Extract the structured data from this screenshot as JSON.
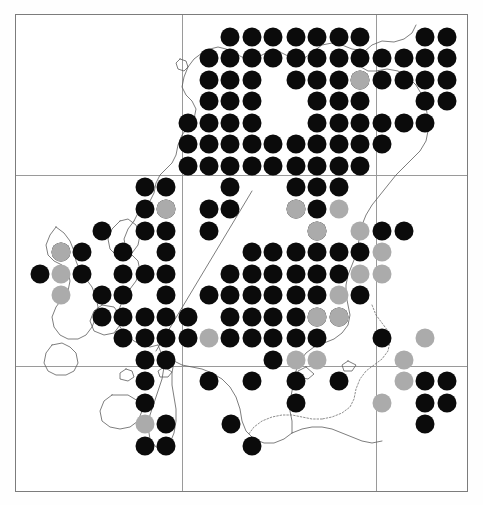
{
  "map": {
    "title": "Species distribution map",
    "region": "Scotland",
    "projection_note": "British National Grid",
    "plate": {
      "x": 15,
      "y": 14,
      "width": 453,
      "height": 478
    },
    "frame_color": "#7c7c7c",
    "background_color": "#ffffff",
    "gridlines": {
      "color": "#9a9a9a",
      "vertical_x": [
        166,
        360
      ],
      "horizontal_y": [
        160,
        351
      ],
      "unit": "100 km square"
    },
    "coastline": {
      "color": "#5d5d5d",
      "inland_border_color": "#5d5d5d",
      "inland_border_style": "dotted"
    }
  },
  "legend": {
    "symbols": [
      {
        "key": "black",
        "label": "Recent record",
        "color": "#0b0b0b",
        "shape": "filled-circle"
      },
      {
        "key": "grey",
        "label": "Older record",
        "color": "#ababab",
        "shape": "filled-circle"
      }
    ],
    "visible": false
  },
  "chart_data": {
    "type": "scatter",
    "xlabel": "",
    "ylabel": "",
    "grid": true,
    "legend_position": "none",
    "xlim": [
      0,
      453
    ],
    "ylim": [
      0,
      478
    ],
    "symbol_diameter_px": 19,
    "grid_spacing_px": 21.5,
    "series": [
      {
        "name": "Recent record",
        "color": "#0b0b0b",
        "count": 216,
        "points": [
          [
            214,
            22
          ],
          [
            236,
            22
          ],
          [
            257,
            22
          ],
          [
            280,
            22
          ],
          [
            301,
            22
          ],
          [
            323,
            22
          ],
          [
            344,
            22
          ],
          [
            409,
            22
          ],
          [
            431,
            22
          ],
          [
            193,
            43
          ],
          [
            214,
            43
          ],
          [
            236,
            43
          ],
          [
            257,
            43
          ],
          [
            280,
            43
          ],
          [
            301,
            43
          ],
          [
            323,
            43
          ],
          [
            344,
            43
          ],
          [
            366,
            43
          ],
          [
            388,
            43
          ],
          [
            409,
            43
          ],
          [
            431,
            43
          ],
          [
            193,
            65
          ],
          [
            214,
            65
          ],
          [
            236,
            65
          ],
          [
            280,
            65
          ],
          [
            301,
            65
          ],
          [
            323,
            65
          ],
          [
            344,
            65
          ],
          [
            366,
            65
          ],
          [
            388,
            65
          ],
          [
            409,
            65
          ],
          [
            431,
            65
          ],
          [
            193,
            86
          ],
          [
            214,
            86
          ],
          [
            236,
            86
          ],
          [
            301,
            86
          ],
          [
            323,
            86
          ],
          [
            344,
            86
          ],
          [
            409,
            86
          ],
          [
            431,
            86
          ],
          [
            172,
            108
          ],
          [
            193,
            108
          ],
          [
            214,
            108
          ],
          [
            236,
            108
          ],
          [
            301,
            108
          ],
          [
            323,
            108
          ],
          [
            344,
            108
          ],
          [
            366,
            108
          ],
          [
            388,
            108
          ],
          [
            409,
            108
          ],
          [
            172,
            129
          ],
          [
            193,
            129
          ],
          [
            214,
            129
          ],
          [
            236,
            129
          ],
          [
            257,
            129
          ],
          [
            280,
            129
          ],
          [
            301,
            129
          ],
          [
            323,
            129
          ],
          [
            344,
            129
          ],
          [
            366,
            129
          ],
          [
            172,
            151
          ],
          [
            193,
            151
          ],
          [
            214,
            151
          ],
          [
            236,
            151
          ],
          [
            257,
            151
          ],
          [
            280,
            151
          ],
          [
            301,
            151
          ],
          [
            323,
            151
          ],
          [
            344,
            151
          ],
          [
            129,
            172
          ],
          [
            150,
            172
          ],
          [
            214,
            172
          ],
          [
            280,
            172
          ],
          [
            301,
            172
          ],
          [
            323,
            172
          ],
          [
            129,
            194
          ],
          [
            150,
            194
          ],
          [
            193,
            194
          ],
          [
            214,
            194
          ],
          [
            280,
            194
          ],
          [
            301,
            194
          ],
          [
            86,
            216
          ],
          [
            129,
            216
          ],
          [
            150,
            216
          ],
          [
            193,
            216
          ],
          [
            301,
            216
          ],
          [
            366,
            216
          ],
          [
            388,
            216
          ],
          [
            45,
            237
          ],
          [
            66,
            237
          ],
          [
            107,
            237
          ],
          [
            150,
            237
          ],
          [
            236,
            237
          ],
          [
            257,
            237
          ],
          [
            280,
            237
          ],
          [
            301,
            237
          ],
          [
            323,
            237
          ],
          [
            344,
            237
          ],
          [
            24,
            259
          ],
          [
            66,
            259
          ],
          [
            107,
            259
          ],
          [
            129,
            259
          ],
          [
            150,
            259
          ],
          [
            214,
            259
          ],
          [
            236,
            259
          ],
          [
            257,
            259
          ],
          [
            280,
            259
          ],
          [
            301,
            259
          ],
          [
            323,
            259
          ],
          [
            86,
            280
          ],
          [
            107,
            280
          ],
          [
            150,
            280
          ],
          [
            193,
            280
          ],
          [
            214,
            280
          ],
          [
            236,
            280
          ],
          [
            257,
            280
          ],
          [
            280,
            280
          ],
          [
            301,
            280
          ],
          [
            344,
            280
          ],
          [
            86,
            302
          ],
          [
            107,
            302
          ],
          [
            129,
            302
          ],
          [
            150,
            302
          ],
          [
            172,
            302
          ],
          [
            214,
            302
          ],
          [
            236,
            302
          ],
          [
            257,
            302
          ],
          [
            280,
            302
          ],
          [
            301,
            302
          ],
          [
            323,
            302
          ],
          [
            107,
            323
          ],
          [
            129,
            323
          ],
          [
            150,
            323
          ],
          [
            172,
            323
          ],
          [
            214,
            323
          ],
          [
            236,
            323
          ],
          [
            257,
            323
          ],
          [
            280,
            323
          ],
          [
            301,
            323
          ],
          [
            366,
            323
          ],
          [
            129,
            345
          ],
          [
            150,
            345
          ],
          [
            257,
            345
          ],
          [
            129,
            366
          ],
          [
            193,
            366
          ],
          [
            236,
            366
          ],
          [
            280,
            366
          ],
          [
            323,
            366
          ],
          [
            409,
            366
          ],
          [
            431,
            366
          ],
          [
            129,
            388
          ],
          [
            280,
            388
          ],
          [
            409,
            388
          ],
          [
            431,
            388
          ],
          [
            150,
            409
          ],
          [
            215,
            409
          ],
          [
            409,
            409
          ],
          [
            129,
            431
          ],
          [
            150,
            431
          ],
          [
            236,
            431
          ]
        ]
      },
      {
        "name": "Older record",
        "color": "#ababab",
        "count": 23,
        "points": [
          [
            344,
            65
          ],
          [
            280,
            194
          ],
          [
            323,
            194
          ],
          [
            301,
            216
          ],
          [
            344,
            216
          ],
          [
            366,
            237
          ],
          [
            45,
            237
          ],
          [
            45,
            259
          ],
          [
            45,
            280
          ],
          [
            150,
            194
          ],
          [
            344,
            259
          ],
          [
            366,
            259
          ],
          [
            323,
            280
          ],
          [
            301,
            302
          ],
          [
            323,
            302
          ],
          [
            193,
            323
          ],
          [
            280,
            345
          ],
          [
            301,
            345
          ],
          [
            409,
            323
          ],
          [
            388,
            366
          ],
          [
            388,
            345
          ],
          [
            366,
            388
          ],
          [
            129,
            409
          ]
        ]
      }
    ]
  }
}
